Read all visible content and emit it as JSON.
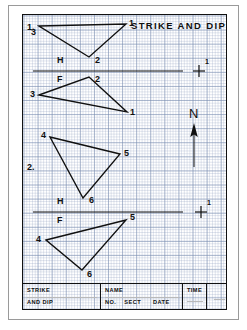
{
  "sheet": {
    "header_title": "STRIKE AND DIP",
    "problem_labels": [
      {
        "id": "problem-1",
        "text": "1.",
        "x": 4,
        "y": 8
      },
      {
        "id": "problem-2",
        "text": "2.",
        "x": 4,
        "y": 148
      }
    ],
    "compass": {
      "label": "N",
      "icon": "north-arrow-icon"
    }
  },
  "problem_1": {
    "horizontal_view": {
      "plane_label": "H",
      "triangle": {
        "points": "16,11 103,9 66,42",
        "vertices": [
          {
            "label": "3",
            "x": 8,
            "y": 14
          },
          {
            "label": "1",
            "x": 106,
            "y": 5
          },
          {
            "label": "2",
            "x": 61,
            "y": 44
          }
        ]
      }
    },
    "frontal_view": {
      "plane_label": "F",
      "triangle": {
        "points": "16,80 66,62 104,97",
        "vertices": [
          {
            "label": "2",
            "x": 62,
            "y": 54
          },
          {
            "label": "3",
            "x": 7,
            "y": 74
          },
          {
            "label": "1",
            "x": 107,
            "y": 95
          }
        ]
      }
    },
    "fold_line": {
      "x1": 10,
      "y1": 56,
      "x2": 160,
      "y2": 56
    },
    "reference_mark": {
      "icon": "plus-cross-icon",
      "cx": 176,
      "cy": 56,
      "label": "1"
    }
  },
  "problem_2": {
    "horizontal_view": {
      "plane_label": "H",
      "triangle": {
        "points": "27,122 97,139 60,183",
        "vertices": [
          {
            "label": "4",
            "x": 18,
            "y": 117
          },
          {
            "label": "5",
            "x": 101,
            "y": 135
          },
          {
            "label": "6",
            "x": 65,
            "y": 183
          }
        ]
      }
    },
    "frontal_view": {
      "plane_label": "F",
      "triangle": {
        "points": "23,225 103,205 59,255",
        "vertices": [
          {
            "label": "5",
            "x": 106,
            "y": 199
          },
          {
            "label": "4",
            "x": 14,
            "y": 220
          },
          {
            "label": "6",
            "x": 63,
            "y": 257
          }
        ]
      }
    },
    "fold_line": {
      "x1": 10,
      "y1": 197,
      "x2": 160,
      "y2": 197
    },
    "reference_mark": {
      "icon": "plus-cross-icon",
      "cx": 178,
      "cy": 197,
      "label": "1"
    }
  },
  "plane_labels": {
    "h1": {
      "text": "H",
      "x": 34,
      "y": 44
    },
    "f1": {
      "text": "F",
      "x": 34,
      "y": 60
    },
    "h2": {
      "text": "H",
      "x": 34,
      "y": 185
    },
    "f2": {
      "text": "F",
      "x": 34,
      "y": 201
    }
  },
  "title_block": {
    "drawing_title_line1": "STRIKE",
    "drawing_title_line2": "AND DIP",
    "name_label": "NAME",
    "no_label": "NO.",
    "sect_label": "SECT",
    "date_label": "DATE",
    "time_label": "TIME"
  },
  "colors": {
    "ink": "#101010",
    "grid_major": "#7a8caf",
    "grid_minor": "#96a5c3",
    "paper": "#ffffff",
    "frame": "#111111"
  }
}
